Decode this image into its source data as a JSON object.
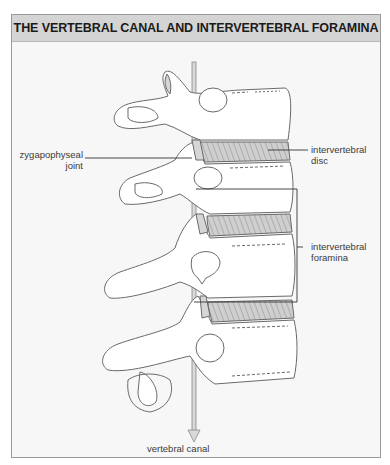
{
  "title": "THE VERTEBRAL CANAL AND INTERVERTEBRAL FORAMINA",
  "labels": {
    "zygapophyseal_joint": [
      "zygapophyseal",
      "joint"
    ],
    "intervertebral_disc": [
      "intervertebral",
      "disc"
    ],
    "intervertebral_foramina": [
      "intervertebral",
      "foramina"
    ],
    "vertebral_canal": "vertebral canal"
  },
  "colors": {
    "title_bar": "#d4d4d4",
    "panel_background": "#f7f7f7",
    "bone_fill": "#ffffff",
    "outline": "#6a6a6a",
    "disc_fill": "#c8c8c8",
    "leader_line": "#333333"
  }
}
